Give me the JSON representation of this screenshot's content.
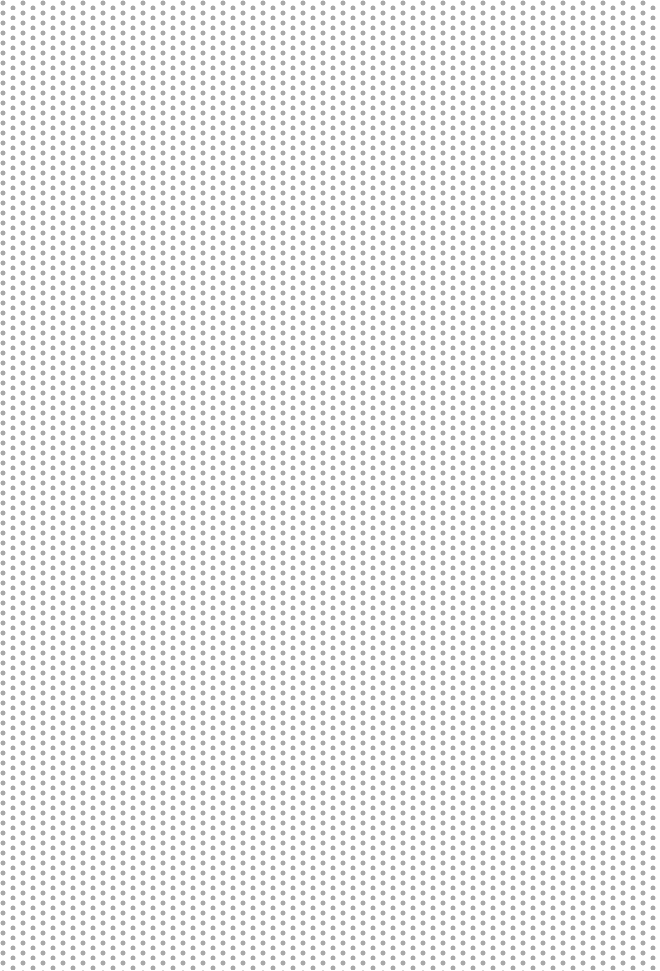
{
  "pattern": {
    "type": "staggered-dot-grid",
    "background_color": "#ffffff",
    "dot_color": "#a9a9a9",
    "dot_diameter_px": 4.5,
    "column_spacing_px": 10,
    "row_spacing_px": 10,
    "stagger_offset_px": 5
  }
}
